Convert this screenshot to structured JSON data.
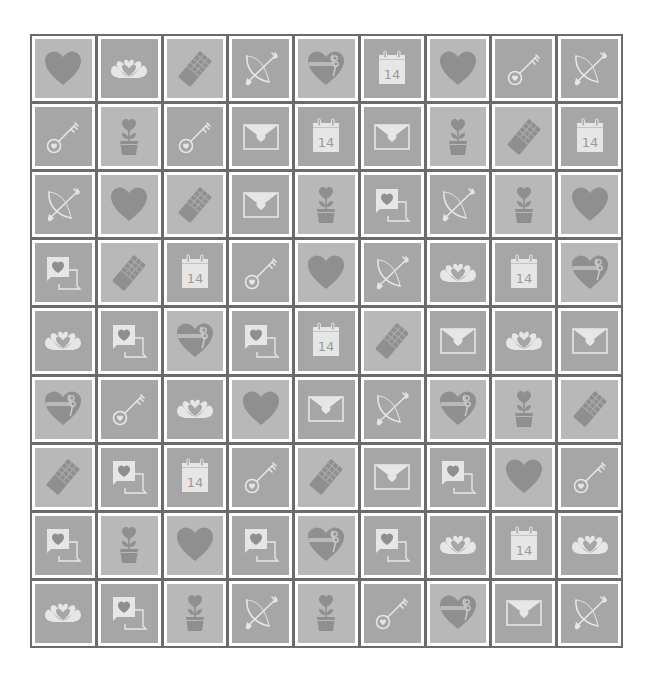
{
  "board": {
    "rows": 9,
    "cols": 9,
    "colors": {
      "frame": "#6b6b6b",
      "cell_gap": "#ffffff",
      "tile_light": "#b8b8b8",
      "tile_dark": "#a6a6a6",
      "icon_fill": "#8f8f8f",
      "icon_line": "#e6e6e6",
      "calendar_text": "#9a9a9a"
    },
    "calendar_day": "14",
    "icon_legend": {
      "heart": "heart-icon",
      "hands": "heart-hands-icon",
      "chocolate": "chocolate-bar-icon",
      "bow": "cupid-bow-icon",
      "gift": "gift-heart-icon",
      "calendar": "calendar-14-icon",
      "key": "heart-key-icon",
      "plant": "heart-flower-pot-icon",
      "envelope": "love-letter-icon",
      "chat": "love-chat-icon"
    },
    "grid": [
      [
        "heart",
        "hands",
        "chocolate",
        "bow",
        "gift",
        "calendar",
        "heart",
        "key",
        "bow"
      ],
      [
        "key",
        "plant",
        "key",
        "envelope",
        "calendar",
        "envelope",
        "plant",
        "chocolate",
        "calendar"
      ],
      [
        "bow",
        "heart",
        "chocolate",
        "envelope",
        "plant",
        "chat",
        "bow",
        "plant",
        "heart"
      ],
      [
        "chat",
        "chocolate",
        "calendar",
        "key",
        "heart",
        "bow",
        "hands",
        "calendar",
        "gift"
      ],
      [
        "hands",
        "chat",
        "gift",
        "chat",
        "calendar",
        "chocolate",
        "envelope",
        "hands",
        "envelope"
      ],
      [
        "gift",
        "key",
        "hands",
        "heart",
        "envelope",
        "bow",
        "gift",
        "plant",
        "chocolate"
      ],
      [
        "chocolate",
        "chat",
        "calendar",
        "key",
        "chocolate",
        "envelope",
        "chat",
        "heart",
        "key"
      ],
      [
        "chat",
        "plant",
        "heart",
        "chat",
        "gift",
        "chat",
        "hands",
        "calendar",
        "hands"
      ],
      [
        "hands",
        "chat",
        "plant",
        "bow",
        "plant",
        "key",
        "gift",
        "envelope",
        "bow"
      ]
    ]
  }
}
